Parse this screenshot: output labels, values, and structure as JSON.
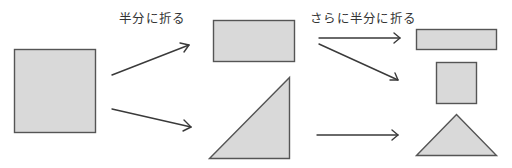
{
  "diagram": {
    "type": "folding-steps",
    "colors": {
      "fill": "#d9d9d9",
      "stroke": "#555555",
      "arrow": "#3a3a3a",
      "text": "#333333"
    },
    "labels": {
      "step1": "半分に折る",
      "step2": "さらに半分に折る"
    },
    "stages": [
      {
        "id": "original",
        "shapes": [
          "square"
        ]
      },
      {
        "id": "folded-once",
        "shapes": [
          "rectangle",
          "right-triangle"
        ]
      },
      {
        "id": "folded-twice",
        "shapes": [
          "thin-rectangle",
          "small-square",
          "isosceles-triangle"
        ]
      }
    ],
    "arrows": [
      {
        "from": "square",
        "to": "rectangle"
      },
      {
        "from": "square",
        "to": "right-triangle"
      },
      {
        "from": "rectangle",
        "to": "thin-rectangle"
      },
      {
        "from": "rectangle",
        "to": "small-square"
      },
      {
        "from": "right-triangle",
        "to": "isosceles-triangle"
      }
    ]
  }
}
